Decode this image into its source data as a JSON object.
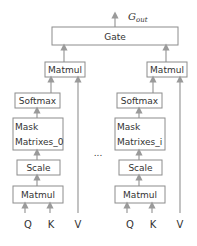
{
  "output": {
    "label": "G",
    "subscript": "out"
  },
  "gate": {
    "label": "Gate"
  },
  "ellipsis": "...",
  "heads": [
    {
      "matmul_out": "Matmul",
      "softmax": "Softmax",
      "mask_line1": "Mask",
      "mask_line2": "Matrixes_0",
      "scale": "Scale",
      "matmul_in": "Matmul",
      "q": "Q",
      "k": "K",
      "v": "V"
    },
    {
      "matmul_out": "Matmul",
      "softmax": "Softmax",
      "mask_line1": "Mask",
      "mask_line2": "Matrixes_i",
      "scale": "Scale",
      "matmul_in": "Matmul",
      "q": "Q",
      "k": "K",
      "v": "V"
    }
  ]
}
